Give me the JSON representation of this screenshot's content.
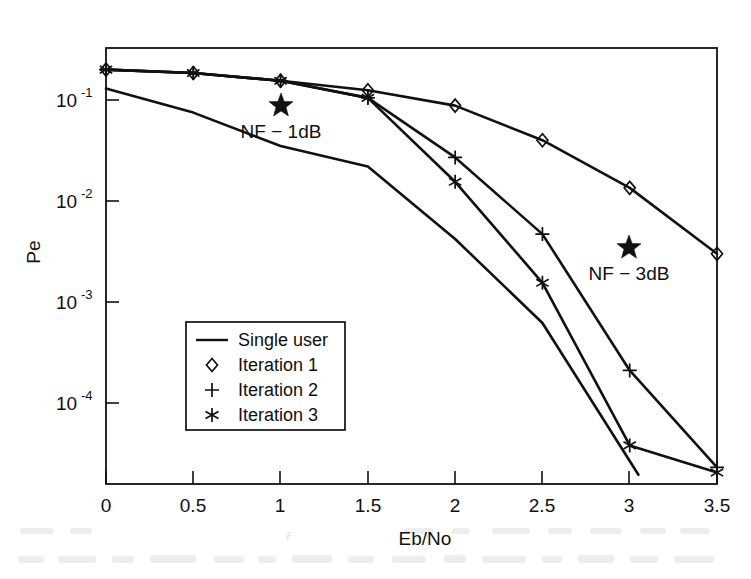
{
  "chart_data": {
    "type": "line",
    "title": "",
    "xlabel": "Eb/No",
    "ylabel": "Pe",
    "xlim": [
      0,
      3.5
    ],
    "ylim": [
      2e-05,
      0.25
    ],
    "yscale": "log",
    "grid": false,
    "legend_position": "lower-left-inside",
    "x_ticks": [
      "0",
      "0.5",
      "1",
      "1.5",
      "2",
      "2.5",
      "3",
      "3.5"
    ],
    "x_tick_values": [
      0,
      0.5,
      1,
      1.5,
      2,
      2.5,
      3,
      3.5
    ],
    "y_ticks": [
      "10^-1",
      "10^-2",
      "10^-3",
      "10^-4"
    ],
    "y_tick_values": [
      0.1,
      0.01,
      0.001,
      0.0001
    ],
    "y_tick_mantissa": [
      "10",
      "10",
      "10",
      "10"
    ],
    "y_tick_exponents": [
      "-1",
      "-2",
      "-3",
      "-4"
    ],
    "x": [
      0,
      0.5,
      1,
      1.5,
      2,
      2.5,
      3,
      3.5
    ],
    "series": [
      {
        "name": "Single user",
        "marker": "none",
        "x": [
          0,
          0.5,
          1,
          1.5,
          2,
          2.5,
          3.05
        ],
        "values": [
          0.13,
          0.075,
          0.035,
          0.022,
          0.0042,
          0.00062,
          1.95e-05
        ]
      },
      {
        "name": "Iteration 1",
        "marker": "diamond",
        "x": [
          0,
          0.5,
          1,
          1.5,
          2,
          2.5,
          3,
          3.5
        ],
        "values": [
          0.2,
          0.185,
          0.155,
          0.125,
          0.088,
          0.04,
          0.0135,
          0.003
        ]
      },
      {
        "name": "Iteration 2",
        "marker": "plus",
        "x": [
          0,
          0.5,
          1,
          1.5,
          2,
          2.5,
          3,
          3.5
        ],
        "values": [
          0.2,
          0.185,
          0.155,
          0.105,
          0.027,
          0.0047,
          0.00021,
          2.3e-05
        ]
      },
      {
        "name": "Iteration 3",
        "marker": "asterisk",
        "x": [
          0,
          0.5,
          1,
          1.5,
          2,
          2.5,
          3,
          3.5
        ],
        "values": [
          0.2,
          0.185,
          0.155,
          0.105,
          0.0155,
          0.00155,
          3.8e-05,
          2.05e-05
        ]
      }
    ],
    "annotations": [
      {
        "text": "NF − 1dB",
        "marker": "star",
        "x": 1.0,
        "y": 0.115
      },
      {
        "text": "NF − 3dB",
        "marker": "star",
        "x": 3.0,
        "y": 0.0032
      }
    ]
  },
  "legend": {
    "entries": [
      {
        "label": "Single user",
        "marker": "line"
      },
      {
        "label": "Iteration 1",
        "marker": "diamond"
      },
      {
        "label": "Iteration 2",
        "marker": "plus"
      },
      {
        "label": "Iteration 3",
        "marker": "asterisk"
      }
    ]
  },
  "axes": {
    "xlabel": "Eb/No",
    "ylabel": "Pe"
  },
  "colors": {
    "line": "#111111",
    "background": "#ffffff",
    "text": "#101010"
  }
}
